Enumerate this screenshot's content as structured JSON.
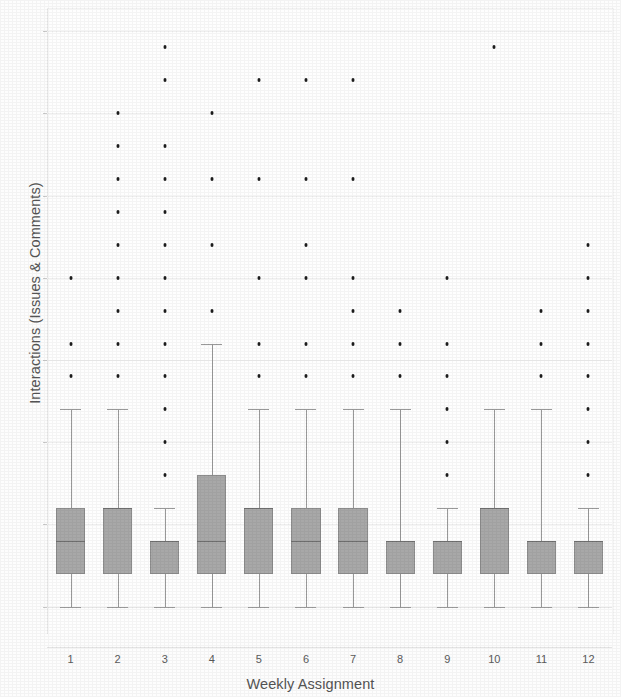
{
  "chart_data": {
    "type": "box",
    "title": "",
    "xlabel": "Weekly Assignment",
    "ylabel": "Interactions (Issues & Comments)",
    "categories": [
      "1",
      "2",
      "3",
      "4",
      "5",
      "6",
      "7",
      "8",
      "9",
      "10",
      "11",
      "12"
    ],
    "ylim": [
      -0.8,
      18.2
    ],
    "ytick_labels": [
      "0.0",
      "2.5",
      "5.0",
      "7.5",
      "10.0",
      "12.5",
      "15.0",
      "17.5"
    ],
    "ytick_values": [
      0,
      2.5,
      5,
      7.5,
      10,
      12.5,
      15,
      17.5
    ],
    "grid": "horizontal",
    "legend": "none",
    "box_fill_color": "#a8a8a8",
    "box_edge_color": "#8d8d8d",
    "median_color": "#6e6e6e",
    "flier_color": "#1c1c1c",
    "boxes": [
      {
        "category": "1",
        "whislo": 0,
        "q1": 1,
        "med": 2,
        "q3": 3,
        "whishi": 6,
        "fliers": [
          7,
          8,
          10
        ]
      },
      {
        "category": "2",
        "whislo": 0,
        "q1": 1,
        "med": 3,
        "q3": 3,
        "whishi": 6,
        "fliers": [
          7,
          8,
          9,
          10,
          11,
          12,
          13,
          14,
          15
        ]
      },
      {
        "category": "3",
        "whislo": 0,
        "q1": 1,
        "med": 2,
        "q3": 2,
        "whishi": 3,
        "fliers": [
          4,
          5,
          6,
          7,
          8,
          9,
          10,
          11,
          12,
          13,
          14,
          16,
          17
        ]
      },
      {
        "category": "4",
        "whislo": 0,
        "q1": 1,
        "med": 2,
        "q3": 4,
        "whishi": 8,
        "fliers": [
          9,
          11,
          13,
          15
        ]
      },
      {
        "category": "5",
        "whislo": 0,
        "q1": 1,
        "med": 3,
        "q3": 3,
        "whishi": 6,
        "fliers": [
          7,
          8,
          10,
          13,
          16
        ]
      },
      {
        "category": "6",
        "whislo": 0,
        "q1": 1,
        "med": 2,
        "q3": 3,
        "whishi": 6,
        "fliers": [
          7,
          8,
          10,
          11,
          13,
          16
        ]
      },
      {
        "category": "7",
        "whislo": 0,
        "q1": 1,
        "med": 2,
        "q3": 3,
        "whishi": 6,
        "fliers": [
          7,
          8,
          9,
          10,
          13,
          16
        ]
      },
      {
        "category": "8",
        "whislo": 0,
        "q1": 1,
        "med": 2,
        "q3": 2,
        "whishi": 6,
        "fliers": [
          7,
          8,
          9
        ]
      },
      {
        "category": "9",
        "whislo": 0,
        "q1": 1,
        "med": 2,
        "q3": 2,
        "whishi": 3,
        "fliers": [
          4,
          5,
          6,
          7,
          8,
          10
        ]
      },
      {
        "category": "10",
        "whislo": 0,
        "q1": 1,
        "med": 3,
        "q3": 3,
        "whishi": 6,
        "fliers": [
          17
        ]
      },
      {
        "category": "11",
        "whislo": 0,
        "q1": 1,
        "med": 2,
        "q3": 2,
        "whishi": 6,
        "fliers": [
          7,
          8,
          9
        ]
      },
      {
        "category": "12",
        "whislo": 0,
        "q1": 1,
        "med": 2,
        "q3": 2,
        "whishi": 3,
        "fliers": [
          4,
          5,
          6,
          7,
          8,
          9,
          10,
          11
        ]
      }
    ]
  }
}
